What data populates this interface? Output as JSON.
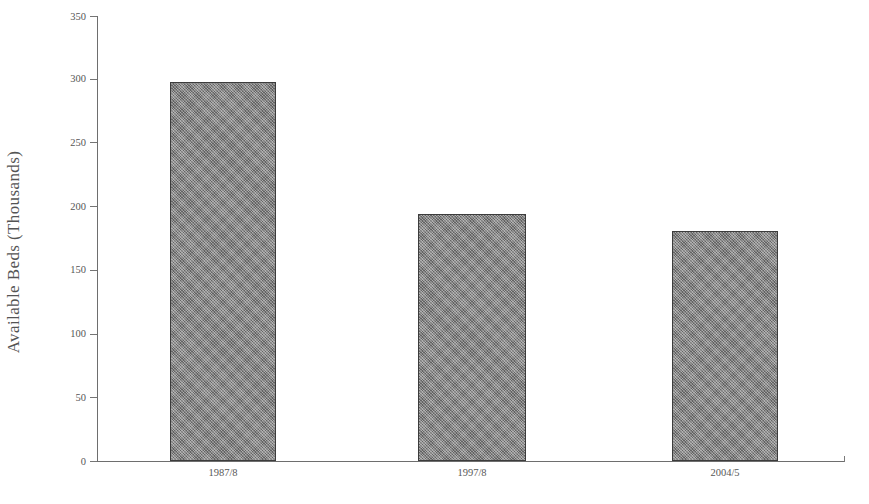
{
  "chart_data": {
    "type": "bar",
    "title": "",
    "subtitle": "",
    "xlabel": "",
    "ylabel": "Available Beds (Thousands)",
    "categories": [
      "1987/8",
      "1997/8",
      "2004/5"
    ],
    "values": [
      298,
      194,
      181
    ],
    "series": [
      {
        "name": "Available Beds",
        "values": [
          298,
          194,
          181
        ]
      }
    ],
    "ylim": [
      0,
      350
    ],
    "ytick_values": [
      0,
      50,
      100,
      150,
      200,
      250,
      300,
      350
    ],
    "ytick_labels": [
      "0",
      "50",
      "100",
      "150",
      "200",
      "250",
      "300",
      "350"
    ],
    "grid": false,
    "legend": false,
    "legend_position": "none",
    "bar_fill_color": "#7f7f7f",
    "bar_border_color": "#3c3c3c",
    "axis_color": "#6e6e6e",
    "text_color": "#545454",
    "background_color": "#ffffff",
    "annotations": []
  },
  "axis": {
    "y_title": "Available Beds (Thousands)"
  }
}
